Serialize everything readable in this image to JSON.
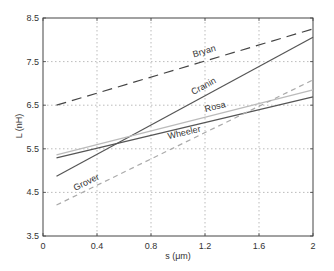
{
  "chart_data": {
    "type": "line",
    "title": "",
    "xlabel": "s (μm)",
    "ylabel": "L (nH)",
    "xlim": [
      0,
      2
    ],
    "ylim": [
      3.5,
      8.5
    ],
    "xticks": [
      "0",
      "0.4",
      "0.8",
      "1.2",
      "1.6",
      "2"
    ],
    "yticks": [
      "3.5",
      "4.5",
      "5.5",
      "6.5",
      "7.5",
      "8.5"
    ],
    "grid": true,
    "legend": "inline labels",
    "x": [
      0.1,
      2.0
    ],
    "series": [
      {
        "name": "Bryan",
        "values": [
          6.5,
          8.25
        ],
        "style": "dashed",
        "color": "#444444"
      },
      {
        "name": "Cranin",
        "values": [
          4.87,
          8.06
        ],
        "style": "solid",
        "color": "#555555"
      },
      {
        "name": "Rosa",
        "values": [
          5.36,
          6.85
        ],
        "style": "solid",
        "color": "#bbbbbb"
      },
      {
        "name": "Wheeler",
        "values": [
          5.29,
          6.69
        ],
        "style": "solid",
        "color": "#555555"
      },
      {
        "name": "Grover",
        "values": [
          4.21,
          7.08
        ],
        "style": "dashed",
        "color": "#aaaaaa"
      }
    ]
  }
}
